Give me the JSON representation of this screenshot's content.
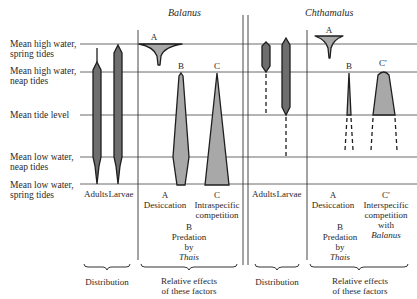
{
  "titles": {
    "balanus": "Balanus",
    "chthamalus": "Chthamalus"
  },
  "tide_levels": [
    {
      "line1": "Mean high water,",
      "line2": "spring tides",
      "y": 44
    },
    {
      "line1": "Mean high water,",
      "line2": "neap tides",
      "y": 72
    },
    {
      "line1": "Mean tide level",
      "line2": "",
      "y": 115
    },
    {
      "line1": "Mean low water,",
      "line2": "neap tides",
      "y": 157
    },
    {
      "line1": "Mean low water,",
      "line2": "spring tides",
      "y": 184
    }
  ],
  "balanus": {
    "distribution": {
      "adults": "Adults",
      "larvae": "Larvae",
      "caption": "Distribution"
    },
    "factors": {
      "A": {
        "letter": "A",
        "name": "Desiccation"
      },
      "B": {
        "letter": "B",
        "line1": "Predation",
        "line2": "by",
        "line3": "Thais"
      },
      "C": {
        "letter": "C",
        "line1": "Intraspecific",
        "line2": "competition"
      },
      "caption_line1": "Relative effects",
      "caption_line2": "of these factors"
    }
  },
  "chthamalus": {
    "distribution": {
      "adults": "Adults",
      "larvae": "Larvae",
      "caption": "Distribution"
    },
    "factors": {
      "A": {
        "letter": "A",
        "name": "Desiccation"
      },
      "B": {
        "letter": "B",
        "line1": "Predation",
        "line2": "by",
        "line3": "Thais"
      },
      "C": {
        "letter": "C′",
        "line1": "Interspecific",
        "line2": "competition",
        "line3": "with",
        "line4": "Balanus"
      },
      "caption_line1": "Relative effects",
      "caption_line2": "of these factors"
    }
  },
  "colors": {
    "distribution_fill": "#6e6e6e",
    "factor_fill": "#a8a8a8",
    "line": "#1e1e1e"
  }
}
